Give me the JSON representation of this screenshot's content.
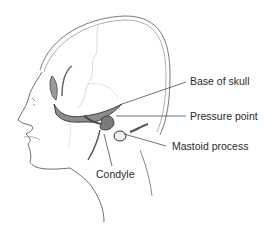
{
  "diagram": {
    "labels": [
      {
        "id": "base-of-skull",
        "text": "Base of skull"
      },
      {
        "id": "pressure-point",
        "text": "Pressure point"
      },
      {
        "id": "mastoid-process",
        "text": "Mastoid process"
      },
      {
        "id": "condyle",
        "text": "Condyle"
      }
    ]
  }
}
